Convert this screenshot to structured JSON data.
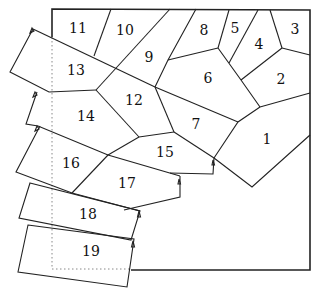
{
  "diagram": {
    "colors": {
      "stroke": "#222222",
      "background": "#ffffff",
      "dotted_outline": "#888888"
    },
    "pieces": [
      {
        "id": 1,
        "label": "1",
        "x": 267,
        "y": 139
      },
      {
        "id": 2,
        "label": "2",
        "x": 281,
        "y": 79
      },
      {
        "id": 3,
        "label": "3",
        "x": 295,
        "y": 29
      },
      {
        "id": 4,
        "label": "4",
        "x": 259,
        "y": 44
      },
      {
        "id": 5,
        "label": "5",
        "x": 235,
        "y": 28
      },
      {
        "id": 6,
        "label": "6",
        "x": 208,
        "y": 78
      },
      {
        "id": 7,
        "label": "7",
        "x": 196,
        "y": 124
      },
      {
        "id": 8,
        "label": "8",
        "x": 204,
        "y": 30
      },
      {
        "id": 9,
        "label": "9",
        "x": 149,
        "y": 57
      },
      {
        "id": 10,
        "label": "10",
        "x": 125,
        "y": 30
      },
      {
        "id": 11,
        "label": "11",
        "x": 78,
        "y": 28
      },
      {
        "id": 12,
        "label": "12",
        "x": 134,
        "y": 100
      },
      {
        "id": 13,
        "label": "13",
        "x": 76,
        "y": 70
      },
      {
        "id": 14,
        "label": "14",
        "x": 86,
        "y": 116
      },
      {
        "id": 15,
        "label": "15",
        "x": 165,
        "y": 152
      },
      {
        "id": 16,
        "label": "16",
        "x": 71,
        "y": 163
      },
      {
        "id": 17,
        "label": "17",
        "x": 127,
        "y": 183
      },
      {
        "id": 18,
        "label": "18",
        "x": 88,
        "y": 214
      },
      {
        "id": 19,
        "label": "19",
        "x": 91,
        "y": 251
      }
    ]
  }
}
